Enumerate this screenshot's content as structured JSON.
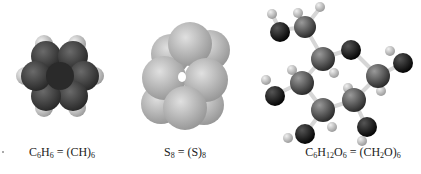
{
  "figure": {
    "molecules": [
      {
        "name": "benzene",
        "model": "space-filling",
        "caption": {
          "parts": [
            [
              "C",
              ""
            ],
            [
              "6",
              "sub"
            ],
            [
              "H",
              ""
            ],
            [
              "6",
              "sub"
            ],
            [
              " = (CH)",
              ""
            ],
            [
              "6",
              "sub"
            ]
          ]
        },
        "caption_text": "C6H6 = (CH)6"
      },
      {
        "name": "sulfur-ring",
        "model": "space-filling",
        "caption": {
          "parts": [
            [
              "S",
              ""
            ],
            [
              "8",
              "sub"
            ],
            [
              " = (S)",
              ""
            ],
            [
              "8",
              "sub"
            ]
          ]
        },
        "caption_text": "S8 = (S)8"
      },
      {
        "name": "glucose",
        "model": "ball-and-stick",
        "caption": {
          "parts": [
            [
              "C",
              ""
            ],
            [
              "6",
              "sub"
            ],
            [
              "H",
              ""
            ],
            [
              "12",
              "sub"
            ],
            [
              "O",
              ""
            ],
            [
              "6",
              "sub"
            ],
            [
              " = (CH",
              ""
            ],
            [
              "2",
              "sub"
            ],
            [
              "O)",
              ""
            ],
            [
              "6",
              "sub"
            ]
          ]
        },
        "caption_text": "C6H12O6 = (CH2O)6"
      }
    ],
    "colors": {
      "carbon": "#3a3a3a",
      "hydrogen": "#c8c8c8",
      "sulfur": "#b4b4b4",
      "oxygen": "#0e0e0e",
      "bond": "#d8d8d8"
    }
  }
}
